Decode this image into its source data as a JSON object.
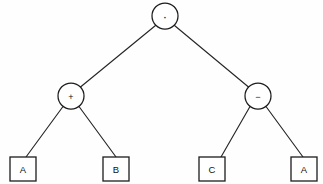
{
  "diagram": {
    "type": "binary-expression-tree",
    "title": "",
    "background_color": "#fefefe",
    "line_color": "#262626",
    "node_fill": "#ffffff",
    "node_stroke": "#1c1c1c",
    "text_color": "#111111",
    "nodes": [
      {
        "id": "root",
        "kind": "operator",
        "shape": "circle",
        "label": "·",
        "icon": "multiply-operator-icon",
        "cx": 165,
        "cy": 16,
        "r": 13
      },
      {
        "id": "op-plus",
        "kind": "operator",
        "shape": "circle",
        "label": "+",
        "icon": "plus-operator-icon",
        "cx": 71,
        "cy": 96,
        "r": 13
      },
      {
        "id": "op-minus",
        "kind": "operator",
        "shape": "circle",
        "label": "−",
        "icon": "minus-operator-icon",
        "cx": 258,
        "cy": 96,
        "r": 13
      },
      {
        "id": "leaf-a-left",
        "kind": "operand",
        "shape": "square",
        "label": "A",
        "x": 10,
        "y": 157,
        "w": 26,
        "h": 24
      },
      {
        "id": "leaf-b",
        "kind": "operand",
        "shape": "square",
        "label": "B",
        "x": 103,
        "y": 157,
        "w": 26,
        "h": 24
      },
      {
        "id": "leaf-c",
        "kind": "operand",
        "shape": "square",
        "label": "C",
        "x": 199,
        "y": 157,
        "w": 26,
        "h": 24
      },
      {
        "id": "leaf-a-right",
        "kind": "operand",
        "shape": "square",
        "label": "A",
        "x": 291,
        "y": 157,
        "w": 26,
        "h": 24
      }
    ],
    "edges": [
      {
        "id": "edge-root-plus",
        "from": "root",
        "to": "op-plus",
        "x1": 155.5,
        "y1": 25.5,
        "x2": 80.5,
        "y2": 87.0
      },
      {
        "id": "edge-root-minus",
        "from": "root",
        "to": "op-minus",
        "x1": 174.5,
        "y1": 25.5,
        "x2": 248.5,
        "y2": 87.0
      },
      {
        "id": "edge-plus-a",
        "from": "op-plus",
        "to": "leaf-a-left",
        "x1": 63.0,
        "y1": 106.5,
        "x2": 26.0,
        "y2": 157.0
      },
      {
        "id": "edge-plus-b",
        "from": "op-plus",
        "to": "leaf-b",
        "x1": 79.0,
        "y1": 106.5,
        "x2": 116.0,
        "y2": 157.0
      },
      {
        "id": "edge-minus-c",
        "from": "op-minus",
        "to": "leaf-c",
        "x1": 250.0,
        "y1": 106.5,
        "x2": 221.0,
        "y2": 157.0
      },
      {
        "id": "edge-minus-a",
        "from": "op-minus",
        "to": "leaf-a-right",
        "x1": 266.0,
        "y1": 106.5,
        "x2": 303.0,
        "y2": 157.0
      }
    ]
  }
}
